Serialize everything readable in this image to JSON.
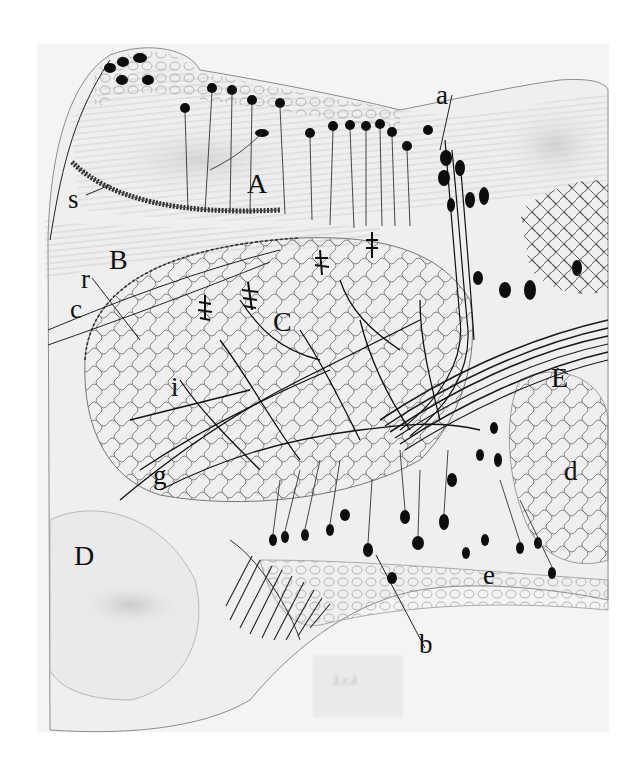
{
  "figure": {
    "type": "histological drawing",
    "style": "pen and ink, neurons on stippled background",
    "ink_color": "#111111",
    "paper_color": "#f4f4f4",
    "background_color": "#ffffff"
  },
  "labels": [
    {
      "id": "a",
      "text": "a",
      "x": 436,
      "y": 82
    },
    {
      "id": "A",
      "text": "A",
      "x": 247,
      "y": 170
    },
    {
      "id": "s",
      "text": "s",
      "x": 68,
      "y": 186
    },
    {
      "id": "B",
      "text": "B",
      "x": 109,
      "y": 246
    },
    {
      "id": "r",
      "text": "r",
      "x": 81,
      "y": 266
    },
    {
      "id": "c",
      "text": "c",
      "x": 70,
      "y": 296
    },
    {
      "id": "C",
      "text": "C",
      "x": 273,
      "y": 308
    },
    {
      "id": "i",
      "text": "i",
      "x": 171,
      "y": 374
    },
    {
      "id": "g",
      "text": "g",
      "x": 153,
      "y": 462
    },
    {
      "id": "E",
      "text": "E",
      "x": 551,
      "y": 364
    },
    {
      "id": "d",
      "text": "d",
      "x": 564,
      "y": 458
    },
    {
      "id": "D",
      "text": "D",
      "x": 74,
      "y": 542
    },
    {
      "id": "e",
      "text": "e",
      "x": 483,
      "y": 562
    },
    {
      "id": "b",
      "text": "b",
      "x": 419,
      "y": 631
    }
  ],
  "stamp": {
    "text": "λ.ε.λ"
  }
}
